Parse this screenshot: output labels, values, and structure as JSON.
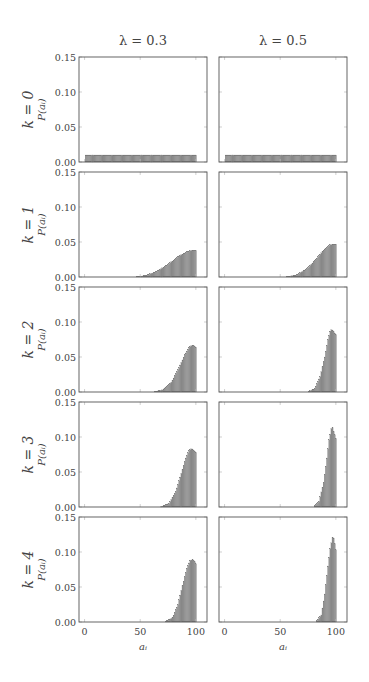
{
  "chart_data": {
    "type": "bar",
    "layout": "grid 5 rows x 2 columns",
    "columns": [
      {
        "title": "λ = 0.3",
        "lambda": 0.3
      },
      {
        "title": "λ = 0.5",
        "lambda": 0.5
      }
    ],
    "rows": [
      {
        "label": "k = 0",
        "k": 0
      },
      {
        "label": "k = 1",
        "k": 1
      },
      {
        "label": "k = 2",
        "k": 2
      },
      {
        "label": "k = 3",
        "k": 3
      },
      {
        "label": "k = 4",
        "k": 4
      }
    ],
    "xlabel": "a_i",
    "ylabel": "P(a_i)",
    "xlim": [
      -5,
      110
    ],
    "ylim": [
      0,
      0.15
    ],
    "xticks": [
      0,
      50,
      100
    ],
    "yticks": [
      "0.00",
      "0.05",
      "0.10",
      "0.15"
    ],
    "bin_range": [
      1,
      100
    ],
    "bar_color": "#8c8c8c",
    "grid": false,
    "panels": [
      {
        "row": 0,
        "col": 0,
        "keypoints": [
          [
            1,
            0.01
          ],
          [
            100,
            0.01
          ]
        ]
      },
      {
        "row": 0,
        "col": 1,
        "keypoints": [
          [
            1,
            0.01
          ],
          [
            100,
            0.01
          ]
        ]
      },
      {
        "row": 1,
        "col": 0,
        "keypoints": [
          [
            1,
            0
          ],
          [
            45,
            0
          ],
          [
            55,
            0.002
          ],
          [
            65,
            0.008
          ],
          [
            75,
            0.018
          ],
          [
            85,
            0.03
          ],
          [
            92,
            0.036
          ],
          [
            96,
            0.038
          ],
          [
            100,
            0.038
          ]
        ]
      },
      {
        "row": 1,
        "col": 1,
        "keypoints": [
          [
            1,
            0
          ],
          [
            55,
            0
          ],
          [
            65,
            0.003
          ],
          [
            75,
            0.013
          ],
          [
            83,
            0.027
          ],
          [
            90,
            0.04
          ],
          [
            95,
            0.046
          ],
          [
            100,
            0.047
          ]
        ]
      },
      {
        "row": 2,
        "col": 0,
        "keypoints": [
          [
            1,
            0
          ],
          [
            62,
            0
          ],
          [
            70,
            0.003
          ],
          [
            78,
            0.014
          ],
          [
            85,
            0.035
          ],
          [
            90,
            0.053
          ],
          [
            94,
            0.064
          ],
          [
            96,
            0.066
          ],
          [
            98,
            0.066
          ],
          [
            100,
            0.064
          ]
        ]
      },
      {
        "row": 2,
        "col": 1,
        "keypoints": [
          [
            1,
            0
          ],
          [
            75,
            0
          ],
          [
            81,
            0.005
          ],
          [
            86,
            0.022
          ],
          [
            90,
            0.05
          ],
          [
            93,
            0.075
          ],
          [
            95,
            0.087
          ],
          [
            96,
            0.089
          ],
          [
            98,
            0.086
          ],
          [
            100,
            0.082
          ]
        ]
      },
      {
        "row": 3,
        "col": 0,
        "keypoints": [
          [
            1,
            0
          ],
          [
            68,
            0
          ],
          [
            76,
            0.005
          ],
          [
            82,
            0.022
          ],
          [
            87,
            0.048
          ],
          [
            91,
            0.07
          ],
          [
            94,
            0.081
          ],
          [
            96,
            0.083
          ],
          [
            98,
            0.081
          ],
          [
            100,
            0.078
          ]
        ]
      },
      {
        "row": 3,
        "col": 1,
        "keypoints": [
          [
            1,
            0
          ],
          [
            80,
            0
          ],
          [
            85,
            0.008
          ],
          [
            89,
            0.035
          ],
          [
            92,
            0.07
          ],
          [
            94,
            0.096
          ],
          [
            96,
            0.112
          ],
          [
            97,
            0.113
          ],
          [
            98,
            0.108
          ],
          [
            100,
            0.098
          ]
        ]
      },
      {
        "row": 4,
        "col": 0,
        "keypoints": [
          [
            1,
            0
          ],
          [
            72,
            0
          ],
          [
            79,
            0.006
          ],
          [
            84,
            0.025
          ],
          [
            88,
            0.052
          ],
          [
            92,
            0.077
          ],
          [
            95,
            0.088
          ],
          [
            97,
            0.089
          ],
          [
            99,
            0.086
          ],
          [
            100,
            0.083
          ]
        ]
      },
      {
        "row": 4,
        "col": 1,
        "keypoints": [
          [
            1,
            0
          ],
          [
            82,
            0
          ],
          [
            87,
            0.01
          ],
          [
            90,
            0.04
          ],
          [
            93,
            0.08
          ],
          [
            95,
            0.105
          ],
          [
            97,
            0.121
          ],
          [
            98,
            0.12
          ],
          [
            99,
            0.112
          ],
          [
            100,
            0.103
          ]
        ]
      }
    ]
  }
}
